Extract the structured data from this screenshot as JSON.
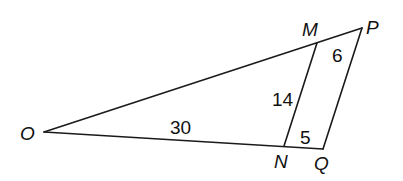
{
  "diagram": {
    "type": "geometry-triangle",
    "vertices": {
      "O": {
        "label": "O",
        "x": 44,
        "y": 132
      },
      "M": {
        "label": "M",
        "x": 317,
        "y": 43
      },
      "P": {
        "label": "P",
        "x": 362,
        "y": 28
      },
      "N": {
        "label": "N",
        "x": 284,
        "y": 146
      },
      "Q": {
        "label": "Q",
        "x": 323,
        "y": 149
      }
    },
    "segments": [
      {
        "name": "OP",
        "from": "O",
        "to": "P"
      },
      {
        "name": "OQ",
        "from": "O",
        "to": "Q"
      },
      {
        "name": "PQ",
        "from": "P",
        "to": "Q"
      },
      {
        "name": "MN",
        "from": "M",
        "to": "N"
      }
    ],
    "measures": {
      "MP": "6",
      "MN": "14",
      "ON": "30",
      "NQ": "5"
    },
    "labels": {
      "O": "O",
      "M": "M",
      "P": "P",
      "N": "N",
      "Q": "Q"
    }
  }
}
